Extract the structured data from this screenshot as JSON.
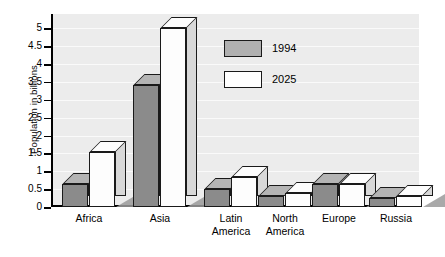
{
  "chart_data": {
    "type": "bar",
    "title": "",
    "xlabel": "",
    "ylabel": "Population in billions",
    "categories": [
      "Africa",
      "Asia",
      "Latin America",
      "North America",
      "Europe",
      "Russia"
    ],
    "series": [
      {
        "name": "1994",
        "color": "#8b8b8b",
        "values": [
          0.65,
          3.4,
          0.5,
          0.3,
          0.63,
          0.25
        ]
      },
      {
        "name": "2025",
        "color": "#fdfdfd",
        "values": [
          1.55,
          5.0,
          0.85,
          0.38,
          0.65,
          0.3
        ]
      }
    ],
    "ylim": [
      0,
      5.4
    ],
    "yticks": [
      "0",
      "0.5",
      "1",
      "1.5",
      "2",
      "2.5",
      "3",
      "3.5",
      "4",
      "4.5",
      "5"
    ],
    "ytick_values": [
      0,
      0.5,
      1,
      1.5,
      2,
      2.5,
      3,
      3.5,
      4,
      4.5,
      5
    ],
    "grid": true,
    "legend_position": "upper-right",
    "style": "3d-bars-with-shadow",
    "plot_background": "#ececec"
  },
  "legend": {
    "entries": [
      {
        "label": "1994",
        "swatch": "gray"
      },
      {
        "label": "2025",
        "swatch": "white"
      }
    ]
  },
  "category_labels": [
    {
      "line1": "Africa",
      "line2": ""
    },
    {
      "line1": "Asia",
      "line2": ""
    },
    {
      "line1": "Latin",
      "line2": "America"
    },
    {
      "line1": "North",
      "line2": "America"
    },
    {
      "line1": "Europe",
      "line2": ""
    },
    {
      "line1": "Russia",
      "line2": ""
    }
  ]
}
